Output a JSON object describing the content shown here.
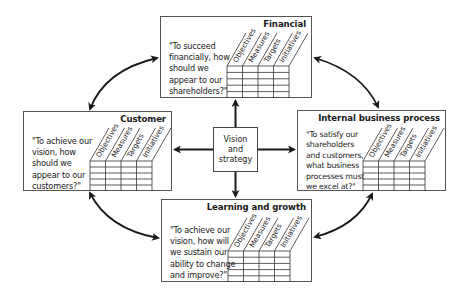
{
  "diagram": {
    "type": "balanced-scorecard",
    "center": {
      "label": "Vision\nand\nstrategy"
    },
    "perspectives": [
      {
        "id": "financial",
        "title": "Financial",
        "question": "\"To succeed\nfinancially, how\nshould we\nappear to our\nshareholders?\"",
        "columns": [
          "Objectives",
          "Measures",
          "Targets",
          "Initiatives"
        ]
      },
      {
        "id": "customer",
        "title": "Customer",
        "question": "\"To achieve our\nvision, how\nshould we\nappear to our\ncustomers?\"",
        "columns": [
          "Objectives",
          "Measures",
          "Targets",
          "Initiatives"
        ]
      },
      {
        "id": "internal",
        "title": "Internal business process",
        "question": "\"To satisfy our\nshareholders\nand customers,\nwhat business\nprocesses must\nwe excel at?\"",
        "columns": [
          "Objectives",
          "Measures",
          "Targets",
          "Initiatives"
        ]
      },
      {
        "id": "learning",
        "title": "Learning and growth",
        "question": "\"To achieve our\nvision, how will\nwe sustain our\nability to change\nand improve?\"",
        "columns": [
          "Objectives",
          "Measures",
          "Targets",
          "Initiatives"
        ]
      }
    ],
    "connections": [
      "center-financial",
      "center-customer",
      "center-internal",
      "center-learning",
      "financial-customer",
      "financial-internal",
      "customer-learning",
      "internal-learning"
    ],
    "colors": {
      "line": "#1a1a1a",
      "border": "#555555",
      "background": "#ffffff"
    }
  }
}
